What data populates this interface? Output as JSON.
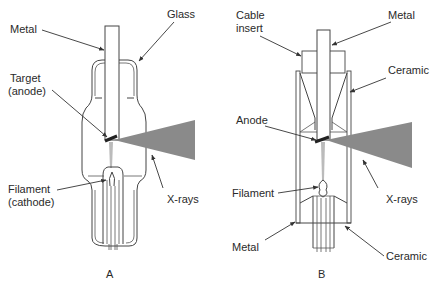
{
  "diagrams": [
    {
      "id": "A",
      "caption": "A",
      "type": "glass X-ray tube",
      "labels": {
        "metal": "Metal",
        "glass": "Glass",
        "target_line1": "Target",
        "target_line2": "(anode)",
        "filament_line1": "Filament",
        "filament_line2": "(cathode)",
        "xrays": "X-rays"
      }
    },
    {
      "id": "B",
      "caption": "B",
      "type": "metal-ceramic X-ray tube",
      "labels": {
        "cable_line1": "Cable",
        "cable_line2": "insert",
        "metal_top": "Metal",
        "ceramic_top": "Ceramic",
        "anode": "Anode",
        "filament": "Filament",
        "xrays": "X-rays",
        "metal_bottom": "Metal",
        "ceramic_bottom": "Ceramic"
      }
    }
  ],
  "colors": {
    "xray_beam": "#8a8a8a",
    "line": "#444444",
    "text": "#2a2a2a"
  }
}
